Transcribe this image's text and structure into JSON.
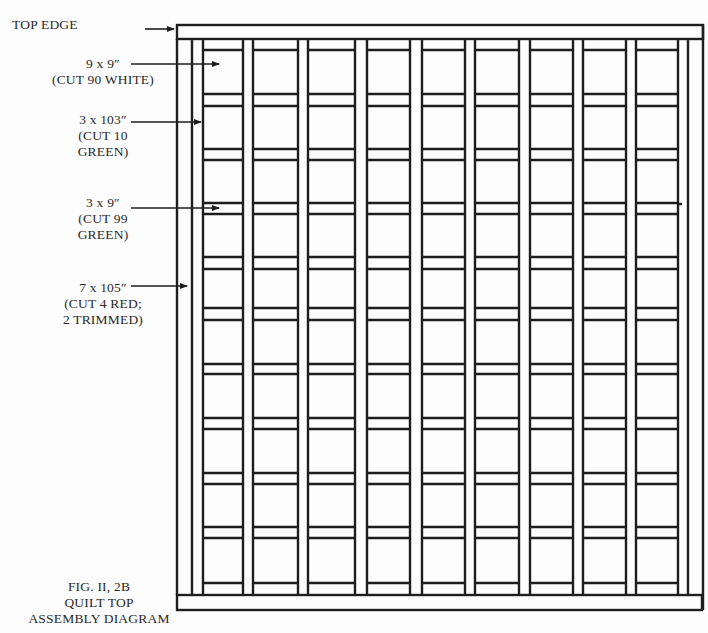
{
  "labels": {
    "top_edge": "TOP EDGE",
    "white_square": {
      "size": "9 x 9″",
      "note": "(CUT 90 WHITE)"
    },
    "long_sash": {
      "size": "3 x 103″",
      "note_line1": "(CUT 10",
      "note_line2": "GREEN)"
    },
    "short_sash": {
      "size": "3 x 9″",
      "note_line1": "(CUT 99",
      "note_line2": "GREEN)"
    },
    "border_strip": {
      "size": "7 x 105″",
      "note_line1": "(CUT 4 RED;",
      "note_line2": "2 TRIMMED)"
    }
  },
  "caption": {
    "line1": "FIG. II, 2B",
    "line2": "QUILT TOP",
    "line3": "ASSEMBLY DIAGRAM"
  },
  "diagram": {
    "columns": 9,
    "rows": 10,
    "outer_border": {
      "x1": 177,
      "y1": 25,
      "x2": 703,
      "y2": 610
    },
    "colors": {
      "line": "#1e1e1e",
      "fill": "#fdfdfd"
    }
  }
}
